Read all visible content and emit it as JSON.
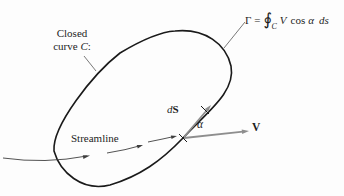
{
  "labels": {
    "closed_curve_line1": "Closed",
    "closed_curve_line2_prefix": "curve ",
    "closed_curve_line2_var": "C",
    "closed_curve_line2_suffix": ":",
    "streamline": "Streamline",
    "ds_differential": "d",
    "ds_vector": "S",
    "alpha": "α",
    "velocity": "V"
  },
  "formula": {
    "lhs": "Γ",
    "equals": "=",
    "integral": "∮",
    "subscript": "C",
    "velocity": "V",
    "operator": "cos",
    "angle": "α",
    "differential": "ds"
  },
  "colors": {
    "curve": "#1a1a1a",
    "vector": "#8e8e8e",
    "thin": "#3f3f3f",
    "text": "#1e1e1e",
    "background": "#fdfdfd"
  }
}
